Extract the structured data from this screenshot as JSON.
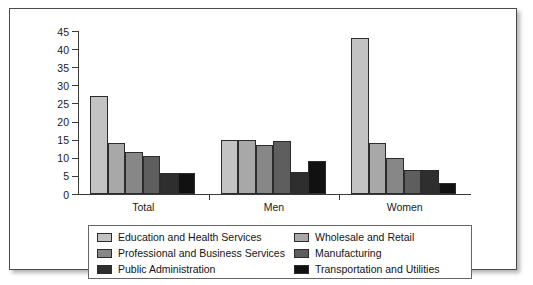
{
  "chart_data": {
    "type": "bar",
    "title": "",
    "subtitle": "",
    "xlabel": "",
    "ylabel": "",
    "ylim": [
      0,
      45
    ],
    "yticks": [
      0,
      5,
      10,
      15,
      20,
      25,
      30,
      35,
      40,
      45
    ],
    "grid": false,
    "legend_position": "bottom",
    "categories": [
      "Total",
      "Men",
      "Women"
    ],
    "series": [
      {
        "name": "Education and Health Services",
        "color": "#c3c3c3",
        "values": [
          27,
          15,
          43
        ]
      },
      {
        "name": "Wholesale and Retail",
        "color": "#a8a8a8",
        "values": [
          14,
          15,
          14
        ]
      },
      {
        "name": "Professional and Business Services",
        "color": "#878787",
        "values": [
          11.5,
          13.6,
          10
        ]
      },
      {
        "name": "Manufacturing",
        "color": "#5e5e5e",
        "values": [
          10.5,
          14.7,
          6.5
        ]
      },
      {
        "name": "Public Administration",
        "color": "#2e2e2e",
        "values": [
          5.7,
          6,
          6.5
        ]
      },
      {
        "name": "Transportation and Utilities",
        "color": "#111111",
        "values": [
          5.8,
          9,
          3
        ]
      }
    ]
  },
  "legend": {
    "columns": [
      {
        "items": [
          {
            "label": "Education and Health Services",
            "color": "#c3c3c3"
          },
          {
            "label": "Professional and Business Services",
            "color": "#878787"
          },
          {
            "label": "Public Administration",
            "color": "#2e2e2e"
          }
        ]
      },
      {
        "items": [
          {
            "label": "Wholesale and Retail",
            "color": "#a8a8a8"
          },
          {
            "label": "Manufacturing",
            "color": "#5e5e5e"
          },
          {
            "label": "Transportation and Utilities",
            "color": "#111111"
          }
        ]
      }
    ]
  }
}
